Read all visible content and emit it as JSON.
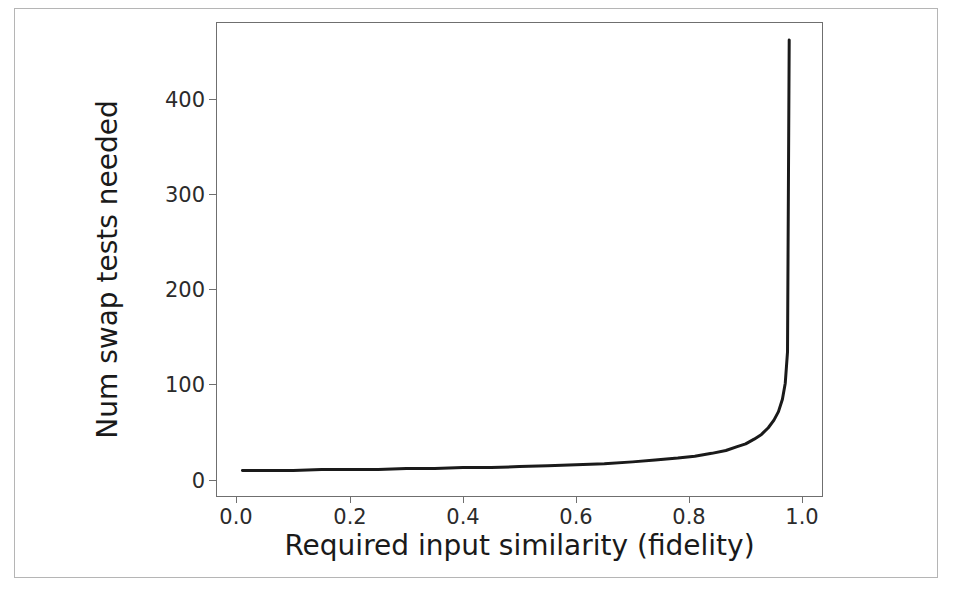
{
  "figure": {
    "background_color": "#ffffff",
    "frame_color": "#b5b5b5",
    "axis_color": "#6f6f6f",
    "curve_color": "#1a1a1a"
  },
  "chart_data": {
    "type": "line",
    "title": "",
    "xlabel": "Required input similarity (fidelity)",
    "ylabel": "Num swap tests needed",
    "xlim": [
      -0.035,
      1.035
    ],
    "ylim": [
      -22,
      477
    ],
    "xticks": [
      0.0,
      0.2,
      0.4,
      0.6,
      0.8,
      1.0
    ],
    "xticklabels": [
      "0.0",
      "0.2",
      "0.4",
      "0.6",
      "0.8",
      "1.0"
    ],
    "yticks": [
      0,
      100,
      200,
      300,
      400
    ],
    "yticklabels": [
      "0",
      "100",
      "200",
      "300",
      "400"
    ],
    "grid": false,
    "legend": null,
    "series": [
      {
        "name": "swap tests needed",
        "linewidth": 3.0,
        "color": "#1a1a1a",
        "x": [
          0.01,
          0.05,
          0.1,
          0.15,
          0.2,
          0.25,
          0.3,
          0.35,
          0.4,
          0.45,
          0.5,
          0.55,
          0.6,
          0.65,
          0.7,
          0.74,
          0.78,
          0.81,
          0.84,
          0.865,
          0.885,
          0.9,
          0.915,
          0.928,
          0.94,
          0.95,
          0.958,
          0.965,
          0.97,
          0.974,
          0.977
        ],
        "y": [
          5,
          5,
          5,
          6,
          6,
          6,
          7,
          7,
          8,
          8,
          9,
          10,
          11,
          12,
          14,
          16,
          18,
          20,
          23,
          26,
          30,
          33,
          38,
          43,
          50,
          58,
          67,
          80,
          97,
          130,
          459
        ]
      }
    ],
    "annotations": []
  },
  "axes": {
    "x_tick_labels": [
      "0.0",
      "0.2",
      "0.4",
      "0.6",
      "0.8",
      "1.0"
    ],
    "y_tick_labels": [
      "400",
      "300",
      "200",
      "100",
      "0"
    ]
  }
}
